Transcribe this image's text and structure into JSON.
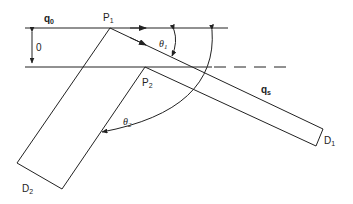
{
  "figure": {
    "labels": {
      "q0": {
        "main": "q",
        "sub": "0"
      },
      "P1": {
        "main": "P",
        "sub": "1"
      },
      "P2": {
        "main": "P",
        "sub": "2"
      },
      "theta1": {
        "main": "θ",
        "sub": "1"
      },
      "theta2": {
        "main": "θ",
        "sub": "2"
      },
      "qs": {
        "main": "q",
        "sub": "s"
      },
      "D1": {
        "main": "D",
        "sub": "1"
      },
      "D2": {
        "main": "D",
        "sub": "2"
      },
      "thickness": "0"
    },
    "colors": {
      "line": "#222222",
      "background": "#ffffff"
    }
  }
}
